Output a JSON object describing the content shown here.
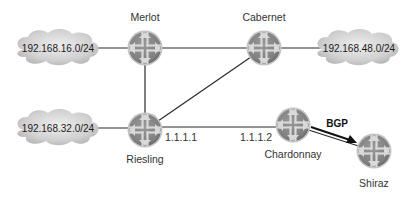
{
  "diagram": {
    "type": "network-topology",
    "colors": {
      "link": "#2a2a2a",
      "router_fill": "#8c8c8c",
      "router_rim": "#bdbdbd",
      "router_cross": "#d8d8d8",
      "cloud_fill": "#cfcfcf",
      "label": "#333333"
    },
    "routers": [
      {
        "id": "merlot",
        "name": "Merlot",
        "x": 145,
        "y": 48
      },
      {
        "id": "cabernet",
        "name": "Cabernet",
        "x": 264,
        "y": 48
      },
      {
        "id": "riesling",
        "name": "Riesling",
        "x": 145,
        "y": 130
      },
      {
        "id": "chardonnay",
        "name": "Chardonnay",
        "x": 293,
        "y": 125
      },
      {
        "id": "shiraz",
        "name": "Shiraz",
        "x": 374,
        "y": 151
      }
    ],
    "networks": [
      {
        "id": "net16",
        "prefix": "192.168.16.0/24",
        "attached_to": "merlot"
      },
      {
        "id": "net48",
        "prefix": "192.168.48.0/24",
        "attached_to": "cabernet"
      },
      {
        "id": "net32",
        "prefix": "192.168.32.0/24",
        "attached_to": "riesling"
      }
    ],
    "links": [
      {
        "from": "merlot",
        "to": "cabernet"
      },
      {
        "from": "merlot",
        "to": "riesling"
      },
      {
        "from": "riesling",
        "to": "cabernet"
      },
      {
        "from": "riesling",
        "to": "chardonnay",
        "from_addr": "1.1.1.1",
        "to_addr": "1.1.1.2"
      },
      {
        "from": "chardonnay",
        "to": "shiraz"
      }
    ],
    "interface_labels": {
      "riesling": "1.1.1.1",
      "chardonnay": "1.1.1.2"
    },
    "annotations": [
      {
        "id": "bgp",
        "text": "BGP",
        "arrow_from": "chardonnay",
        "arrow_to": "shiraz"
      }
    ]
  }
}
